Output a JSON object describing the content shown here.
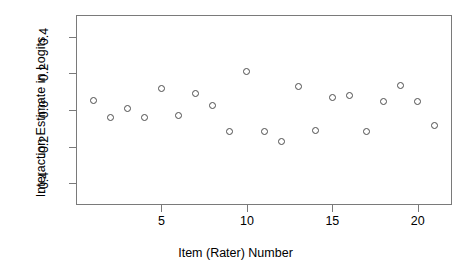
{
  "chart_data": {
    "type": "scatter",
    "title": "",
    "xlabel": "Item (Rater) Number",
    "ylabel": "Interaction Estimate in Logits",
    "x": [
      1,
      2,
      3,
      4,
      5,
      6,
      7,
      8,
      9,
      10,
      11,
      12,
      13,
      14,
      15,
      16,
      17,
      18,
      19,
      20,
      21
    ],
    "values": [
      0.05,
      -0.04,
      0.01,
      -0.04,
      0.12,
      -0.03,
      0.09,
      0.025,
      -0.115,
      0.21,
      -0.115,
      -0.17,
      0.13,
      -0.11,
      0.07,
      0.08,
      -0.12,
      0.045,
      0.135,
      0.045,
      -0.085
    ],
    "series": [
      {
        "name": "Interaction Estimate",
        "values": [
          0.05,
          -0.04,
          0.01,
          -0.04,
          0.12,
          -0.03,
          0.09,
          0.025,
          -0.115,
          0.21,
          -0.115,
          -0.17,
          0.13,
          -0.11,
          0.07,
          0.08,
          -0.12,
          0.045,
          0.135,
          0.045,
          -0.085
        ]
      }
    ],
    "xlim": [
      0.0,
      22.0
    ],
    "ylim": [
      -0.52,
      0.52
    ],
    "xticks": [
      5,
      10,
      15,
      20
    ],
    "xtick_labels": [
      "5",
      "10",
      "15",
      "20"
    ],
    "yticks": [
      0.4,
      0.2,
      0.0,
      -0.2,
      -0.4
    ],
    "ytick_labels": [
      "0.4",
      "0.2",
      "0.0",
      "-0.2",
      "-0.4"
    ],
    "grid": false,
    "legend": null,
    "marker": "open-circle",
    "marker_color": "#4d4d4d",
    "axis_color": "#7a7a7a",
    "background": "#ffffff"
  }
}
